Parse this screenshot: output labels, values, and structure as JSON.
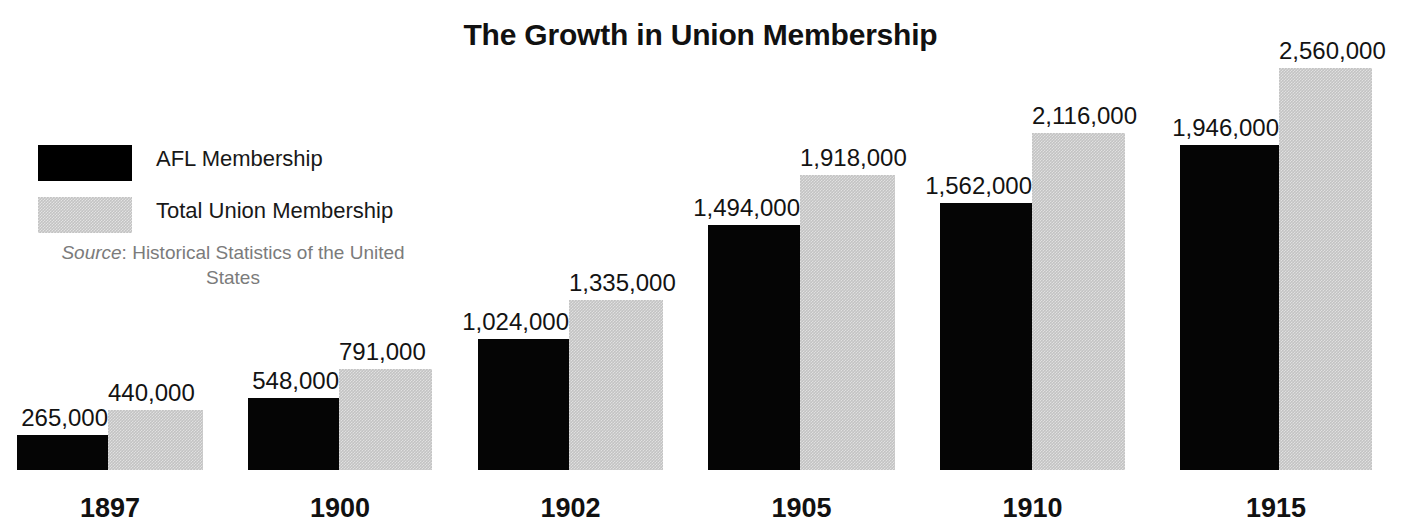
{
  "chart_data": {
    "type": "bar",
    "title": "The Growth in Union Membership",
    "xlabel": "",
    "ylabel": "",
    "grid": false,
    "legend_position": "top-left",
    "ylim": [
      0,
      2700000
    ],
    "categories": [
      "1897",
      "1900",
      "1902",
      "1905",
      "1910",
      "1915"
    ],
    "series": [
      {
        "name": "AFL Membership",
        "color": "#000000",
        "values": [
          265000,
          548000,
          1024000,
          1494000,
          1562000,
          1946000
        ],
        "labels": [
          "265,000",
          "548,000",
          "1,024,000",
          "1,494,000",
          "1,562,000",
          "1,946,000"
        ]
      },
      {
        "name": "Total Union Membership",
        "color": "#c3c3c3",
        "values": [
          440000,
          791000,
          1335000,
          1918000,
          2116000,
          2560000
        ],
        "labels": [
          "440,000",
          "791,000",
          "1,335,000",
          "1,918,000",
          "2,116,000",
          "2,560,000"
        ]
      }
    ],
    "annotations": [
      "Source: Historical Statistics of the United States"
    ]
  },
  "title": "The Growth in Union Membership",
  "legend": {
    "items": [
      {
        "label": "AFL Membership",
        "swatch": "black-square-icon"
      },
      {
        "label": "Total Union Membership",
        "swatch": "gray-square-icon"
      }
    ],
    "source": {
      "prefix": "Source",
      "separator": ": ",
      "text": "Historical Statistics of the United States"
    }
  },
  "groups": [
    {
      "year": "1897",
      "afl_label": "265,000",
      "total_label": "440,000",
      "afl_height_px": 35,
      "total_height_px": 60,
      "left_px": 17,
      "afl_width_px": 91,
      "total_width_px": 95
    },
    {
      "year": "1900",
      "afl_label": "548,000",
      "total_label": "791,000",
      "afl_height_px": 72,
      "total_height_px": 101,
      "left_px": 248,
      "afl_width_px": 91,
      "total_width_px": 93
    },
    {
      "year": "1902",
      "afl_label": "1,024,000",
      "total_label": "1,335,000",
      "afl_height_px": 131,
      "total_height_px": 170,
      "left_px": 478,
      "afl_width_px": 91,
      "total_width_px": 94
    },
    {
      "year": "1905",
      "afl_label": "1,494,000",
      "total_label": "1,918,000",
      "afl_height_px": 245,
      "total_height_px": 295,
      "left_px": 708,
      "afl_width_px": 92,
      "total_width_px": 95
    },
    {
      "year": "1910",
      "afl_label": "1,562,000",
      "total_label": "2,116,000",
      "afl_height_px": 267,
      "total_height_px": 337,
      "left_px": 940,
      "afl_width_px": 92,
      "total_width_px": 93
    },
    {
      "year": "1915",
      "afl_label": "1,946,000",
      "total_label": "2,560,000",
      "afl_height_px": 325,
      "total_height_px": 402,
      "left_px": 1180,
      "afl_width_px": 99,
      "total_width_px": 93
    }
  ]
}
